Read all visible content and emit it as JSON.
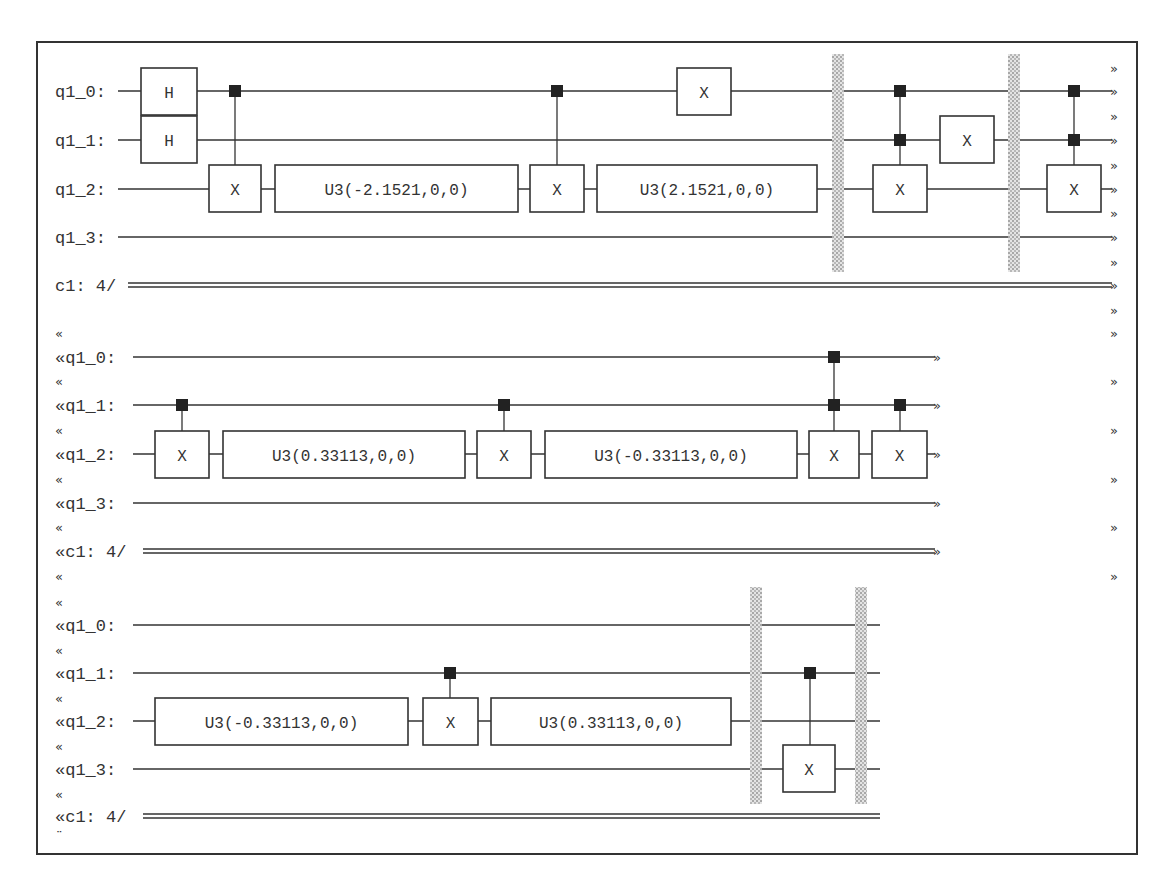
{
  "colors": {
    "wire": "#333333",
    "box_border": "#333333",
    "control": "#222222",
    "barrier": "#c8c8c8",
    "frame": "#333333"
  },
  "blocks": [
    {
      "id": "block-1",
      "label_x": 55,
      "label_prefix": "",
      "wire_start": 118,
      "wire_end": 1112,
      "arrow_x": 1113,
      "continuation_right": "»",
      "continuation_left": "",
      "rows": [
        {
          "label": "q1_0:",
          "y": 91,
          "type": "q"
        },
        {
          "label": "q1_1:",
          "y": 140,
          "type": "q"
        },
        {
          "label": "q1_2:",
          "y": 189,
          "type": "q"
        },
        {
          "label": "q1_3:",
          "y": 237,
          "type": "q"
        },
        {
          "label": "c1: 4/",
          "y": 285,
          "type": "c"
        }
      ],
      "interleave_markers_y": [
        68,
        116,
        165,
        213,
        262,
        310
      ],
      "gates": [
        {
          "type": "box",
          "label": "H",
          "x": 141,
          "y": 68,
          "w": 56,
          "h": 47
        },
        {
          "type": "box",
          "label": "H",
          "x": 141,
          "y": 116,
          "w": 56,
          "h": 47
        },
        {
          "type": "box",
          "label": "X",
          "x": 209,
          "y": 165,
          "w": 52,
          "h": 47
        },
        {
          "type": "box",
          "label": "U3(-2.1521,0,0)",
          "x": 275,
          "y": 165,
          "w": 243,
          "h": 47
        },
        {
          "type": "box",
          "label": "X",
          "x": 530,
          "y": 165,
          "w": 54,
          "h": 47
        },
        {
          "type": "box",
          "label": "U3(2.1521,0,0)",
          "x": 597,
          "y": 165,
          "w": 220,
          "h": 47
        },
        {
          "type": "box",
          "label": "X",
          "x": 677,
          "y": 68,
          "w": 54,
          "h": 47
        },
        {
          "type": "box",
          "label": "X",
          "x": 873,
          "y": 165,
          "w": 54,
          "h": 47
        },
        {
          "type": "box",
          "label": "X",
          "x": 940,
          "y": 116,
          "w": 54,
          "h": 47
        },
        {
          "type": "box",
          "label": "X",
          "x": 1047,
          "y": 165,
          "w": 54,
          "h": 47
        }
      ],
      "controls": [
        {
          "x": 235,
          "ys": [
            91
          ],
          "target_y": 165
        },
        {
          "x": 557,
          "ys": [
            91
          ],
          "target_y": 165
        },
        {
          "x": 900,
          "ys": [
            91,
            140
          ],
          "target_y": 165
        },
        {
          "x": 1074,
          "ys": [
            91,
            140
          ],
          "target_y": 165
        }
      ],
      "barriers": [
        {
          "x": 838,
          "y1": 54,
          "y2": 272
        },
        {
          "x": 1014,
          "y1": 54,
          "y2": 272
        }
      ],
      "h_gate_shift_left": true
    },
    {
      "id": "block-2",
      "label_x": 55,
      "label_prefix": "«",
      "wire_start": 133,
      "wire_end": 935,
      "arrow_x": 936,
      "continuation_right": "»",
      "continuation_left": "«",
      "rows": [
        {
          "label": "«q1_0:",
          "y": 357,
          "type": "q"
        },
        {
          "label": "«q1_1:",
          "y": 405,
          "type": "q"
        },
        {
          "label": "«q1_2:",
          "y": 454,
          "type": "q"
        },
        {
          "label": "«q1_3:",
          "y": 503,
          "type": "q"
        },
        {
          "label": "«c1: 4/",
          "y": 551,
          "type": "c"
        }
      ],
      "interleave_markers_y": [
        333,
        381,
        430,
        479,
        527,
        576
      ],
      "gates": [
        {
          "type": "box",
          "label": "X",
          "x": 155,
          "y": 431,
          "w": 54,
          "h": 47
        },
        {
          "type": "box",
          "label": "U3(0.33113,0,0)",
          "x": 223,
          "y": 431,
          "w": 242,
          "h": 47
        },
        {
          "type": "box",
          "label": "X",
          "x": 477,
          "y": 431,
          "w": 54,
          "h": 47
        },
        {
          "type": "box",
          "label": "U3(-0.33113,0,0)",
          "x": 545,
          "y": 431,
          "w": 252,
          "h": 47
        },
        {
          "type": "box",
          "label": "X",
          "x": 809,
          "y": 431,
          "w": 50,
          "h": 47
        },
        {
          "type": "box",
          "label": "X",
          "x": 872,
          "y": 431,
          "w": 55,
          "h": 47
        }
      ],
      "controls": [
        {
          "x": 182,
          "ys": [
            405
          ],
          "target_y": 431
        },
        {
          "x": 504,
          "ys": [
            405
          ],
          "target_y": 431
        },
        {
          "x": 834,
          "ys": [
            357,
            405
          ],
          "target_y": 431
        },
        {
          "x": 900,
          "ys": [
            405
          ],
          "target_y": 431
        }
      ],
      "barriers": []
    },
    {
      "id": "block-3",
      "label_x": 55,
      "label_prefix": "«",
      "wire_start": 133,
      "wire_end": 880,
      "arrow_x": null,
      "continuation_right": "",
      "continuation_left": "«",
      "rows": [
        {
          "label": "«q1_0:",
          "y": 625,
          "type": "q"
        },
        {
          "label": "«q1_1:",
          "y": 673,
          "type": "q"
        },
        {
          "label": "«q1_2:",
          "y": 721,
          "type": "q"
        },
        {
          "label": "«q1_3:",
          "y": 769,
          "type": "q"
        },
        {
          "label": "«c1: 4/",
          "y": 816,
          "type": "c"
        }
      ],
      "interleave_markers_y": [
        602,
        650,
        698,
        746,
        794
      ],
      "end_marker": "¨",
      "end_marker_y": 840,
      "gates": [
        {
          "type": "box",
          "label": "U3(-0.33113,0,0)",
          "x": 155,
          "y": 698,
          "w": 253,
          "h": 47
        },
        {
          "type": "box",
          "label": "X",
          "x": 423,
          "y": 698,
          "w": 55,
          "h": 47
        },
        {
          "type": "box",
          "label": "U3(0.33113,0,0)",
          "x": 491,
          "y": 698,
          "w": 240,
          "h": 47
        },
        {
          "type": "box",
          "label": "X",
          "x": 783,
          "y": 745,
          "w": 52,
          "h": 47
        }
      ],
      "controls": [
        {
          "x": 450,
          "ys": [
            673
          ],
          "target_y": 698
        },
        {
          "x": 810,
          "ys": [
            673
          ],
          "target_y": 745
        }
      ],
      "barriers": [
        {
          "x": 756,
          "y1": 587,
          "y2": 804
        },
        {
          "x": 861,
          "y1": 587,
          "y2": 804
        }
      ]
    }
  ]
}
